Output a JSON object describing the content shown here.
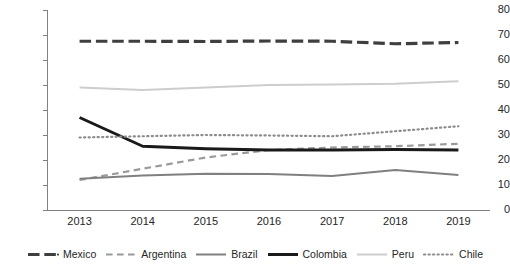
{
  "chart_data": {
    "type": "line",
    "title": "",
    "xlabel": "",
    "ylabel": "",
    "categories": [
      2013,
      2014,
      2015,
      2016,
      2017,
      2018,
      2019
    ],
    "xtick_labels": [
      "2013",
      "2014",
      "2015",
      "2016",
      "2017",
      "2018",
      "2019"
    ],
    "ytick_labels": [
      "80",
      "70",
      "60",
      "50",
      "40",
      "30",
      "20",
      "10",
      "0"
    ],
    "ylim": [
      0,
      80
    ],
    "ytick_step": 10,
    "grid": false,
    "legend_position": "bottom",
    "series": [
      {
        "name": "Mexico",
        "values": [
          67.5,
          67.5,
          67.4,
          67.6,
          67.5,
          66.5,
          67.0
        ],
        "color": "#3f3f3f",
        "style": "long-dash",
        "width": 3.2
      },
      {
        "name": "Argentina",
        "values": [
          12.0,
          16.5,
          21.0,
          24.0,
          25.0,
          25.5,
          26.5
        ],
        "color": "#9a9a9a",
        "style": "dash",
        "width": 2.2
      },
      {
        "name": "Brazil",
        "values": [
          12.5,
          13.8,
          14.5,
          14.4,
          13.6,
          16.0,
          14.0
        ],
        "color": "#808080",
        "style": "solid",
        "width": 2.0
      },
      {
        "name": "Colombia",
        "values": [
          37.0,
          25.5,
          24.5,
          24.0,
          24.0,
          24.2,
          24.0
        ],
        "color": "#1a1a1a",
        "style": "solid",
        "width": 3.0
      },
      {
        "name": "Peru",
        "values": [
          49.0,
          48.0,
          49.0,
          50.0,
          50.2,
          50.5,
          51.5
        ],
        "color": "#cdcdcd",
        "style": "solid",
        "width": 2.0
      },
      {
        "name": "Chile",
        "values": [
          29.0,
          29.5,
          30.0,
          29.8,
          29.5,
          31.5,
          33.5
        ],
        "color": "#8c8c8c",
        "style": "dot",
        "width": 2.2
      }
    ]
  },
  "legend": {
    "items": [
      {
        "label": "Mexico"
      },
      {
        "label": "Argentina"
      },
      {
        "label": "Brazil"
      },
      {
        "label": "Colombia"
      },
      {
        "label": "Peru"
      },
      {
        "label": "Chile"
      }
    ]
  }
}
